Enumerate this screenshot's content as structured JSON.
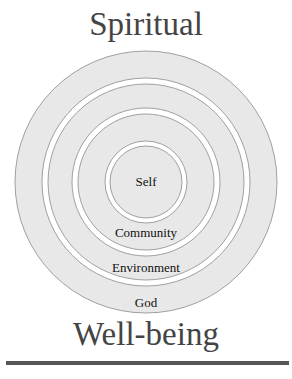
{
  "diagram": {
    "title_top": "Spiritual",
    "title_bottom": "Well-being",
    "center": {
      "x": 146,
      "y": 182
    },
    "rings": [
      {
        "label": "God",
        "outer_radius": 131,
        "inner_radius": 104,
        "label_y": 303
      },
      {
        "label": "Environment",
        "outer_radius": 98,
        "inner_radius": 74,
        "label_y": 268
      },
      {
        "label": "Community",
        "outer_radius": 68,
        "inner_radius": 41,
        "label_y": 233
      },
      {
        "label": "Self",
        "outer_radius": 36,
        "inner_radius": 0,
        "label_y": 186
      }
    ],
    "colors": {
      "ring_fill": "#e8e8e8",
      "ring_stroke": "#8a8a8a",
      "gap": "#ffffff",
      "title": "#444444"
    }
  }
}
